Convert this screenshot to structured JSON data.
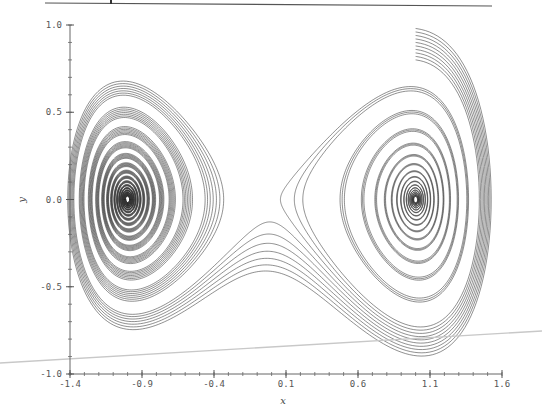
{
  "chart_data": {
    "type": "line",
    "subtype": "phase-portrait",
    "title": "",
    "xlabel": "x",
    "ylabel": "y",
    "xlim": [
      -1.4,
      1.6
    ],
    "ylim": [
      -1.0,
      1.0
    ],
    "x_ticks": [
      -1.4,
      -0.9,
      -0.4,
      0.1,
      0.6,
      1.1,
      1.6
    ],
    "x_tick_labels": [
      "-1.4",
      "-0.9",
      "-0.4",
      "0.1",
      "0.6",
      "1.1",
      "1.6"
    ],
    "y_ticks": [
      -1.0,
      -0.5,
      0.0,
      0.5,
      1.0
    ],
    "y_tick_labels": [
      "-1.0",
      "-0.5",
      "0.0",
      "0.5",
      "1.0"
    ],
    "x_minor_step": 0.1,
    "y_minor_step": 0.1,
    "grid": false,
    "legend": null,
    "system": {
      "description": "Damped double-well oscillator: x' = y, y' = x - x^3 - delta*y",
      "delta": 0.1,
      "equilibria": [
        [
          -1.0,
          0.0
        ],
        [
          1.0,
          0.0
        ]
      ]
    },
    "trajectories": {
      "count": 10,
      "start_x": 1.0,
      "start_y_values": [
        0.8,
        0.82,
        0.84,
        0.86,
        0.88,
        0.9,
        0.92,
        0.94,
        0.96,
        0.98
      ],
      "t_max": 80,
      "dt": 0.01,
      "color": "#333333",
      "stroke_width": 0.55
    },
    "annotations": [
      {
        "type": "top-rule",
        "note": "horizontal rule above plot"
      },
      {
        "type": "faint-diagonal-line",
        "color": "#c8c8c8"
      }
    ]
  }
}
